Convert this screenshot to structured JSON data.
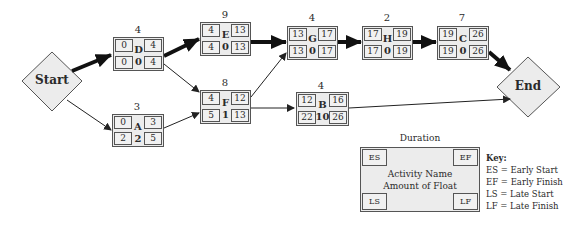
{
  "diagram": {
    "type": "activity-on-node network (critical path)",
    "start_label": "Start",
    "end_label": "End",
    "nodes": {
      "D": {
        "name": "D",
        "duration": "4",
        "es": "0",
        "ef": "4",
        "ls": "0",
        "lf": "4",
        "float": "0"
      },
      "A": {
        "name": "A",
        "duration": "3",
        "es": "0",
        "ef": "3",
        "ls": "2",
        "lf": "5",
        "float": "2"
      },
      "E": {
        "name": "E",
        "duration": "9",
        "es": "4",
        "ef": "13",
        "ls": "4",
        "lf": "13",
        "float": "0"
      },
      "F": {
        "name": "F",
        "duration": "8",
        "es": "4",
        "ef": "12",
        "ls": "5",
        "lf": "13",
        "float": "1"
      },
      "G": {
        "name": "G",
        "duration": "4",
        "es": "13",
        "ef": "17",
        "ls": "13",
        "lf": "17",
        "float": "0"
      },
      "B": {
        "name": "B",
        "duration": "4",
        "es": "12",
        "ef": "16",
        "ls": "22",
        "lf": "26",
        "float": "10"
      },
      "H": {
        "name": "H",
        "duration": "2",
        "es": "17",
        "ef": "19",
        "ls": "17",
        "lf": "19",
        "float": "0"
      },
      "C": {
        "name": "C",
        "duration": "7",
        "es": "19",
        "ef": "26",
        "ls": "19",
        "lf": "26",
        "float": "0"
      }
    },
    "edges": [
      {
        "from": "Start",
        "to": "D",
        "critical": true
      },
      {
        "from": "Start",
        "to": "A",
        "critical": false
      },
      {
        "from": "D",
        "to": "E",
        "critical": true
      },
      {
        "from": "D",
        "to": "F",
        "critical": false
      },
      {
        "from": "A",
        "to": "F",
        "critical": false
      },
      {
        "from": "E",
        "to": "G",
        "critical": true
      },
      {
        "from": "F",
        "to": "G",
        "critical": false
      },
      {
        "from": "F",
        "to": "B",
        "critical": false
      },
      {
        "from": "G",
        "to": "H",
        "critical": true
      },
      {
        "from": "H",
        "to": "C",
        "critical": true
      },
      {
        "from": "C",
        "to": "End",
        "critical": true
      },
      {
        "from": "B",
        "to": "End",
        "critical": false
      }
    ],
    "critical_path": [
      "Start",
      "D",
      "E",
      "G",
      "H",
      "C",
      "End"
    ]
  },
  "key": {
    "duration_label": "Duration",
    "es": "ES",
    "ef": "EF",
    "ls": "LS",
    "lf": "LF",
    "center_line1": "Activity Name",
    "center_line2": "Amount of Float",
    "legend_title": "Key:",
    "legend": [
      "ES = Early Start",
      "EF = Early Finish",
      "LS = Late Start",
      "LF = Late Finish"
    ]
  },
  "colors": {
    "node_fill": "#ececec",
    "border": "#555555",
    "arrow": "#222222",
    "critical_arrow": "#111111"
  }
}
